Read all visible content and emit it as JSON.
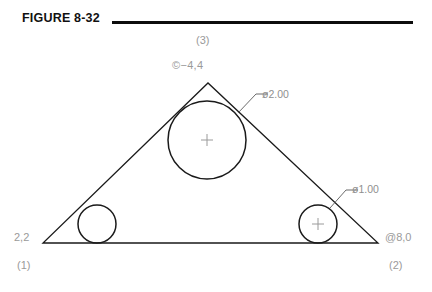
{
  "figure": {
    "title": "FIGURE 8-32",
    "rule_color": "#0d0d0d"
  },
  "drawing": {
    "line_color": "#1a1a1a",
    "annotation_color": "#9a9a9a",
    "triangle": {
      "vertices": [
        {
          "id": "1",
          "label": "(1)",
          "coord_label": "2,2",
          "x": 43,
          "y": 243
        },
        {
          "id": "2",
          "label": "(2)",
          "coord_label": "@8,0",
          "x": 378,
          "y": 243
        },
        {
          "id": "3",
          "label": "(3)",
          "coord_label": "@-4,4",
          "x": 208,
          "y": 83
        }
      ]
    },
    "circles": [
      {
        "name": "apex-circle",
        "cx": 207,
        "cy": 140,
        "r": 39,
        "center_mark": true,
        "dimension": "2.00"
      },
      {
        "name": "bottom-left-circle",
        "cx": 97,
        "cy": 224,
        "r": 19,
        "center_mark": false,
        "dimension": "1.00"
      },
      {
        "name": "bottom-right-circle",
        "cx": 318,
        "cy": 224,
        "r": 19,
        "center_mark": true,
        "dimension": "1.00"
      }
    ],
    "dimensions": [
      {
        "name": "diameter-large",
        "text": "ø2.00"
      },
      {
        "name": "diameter-small",
        "text": "ø1.00"
      }
    ]
  },
  "labels": {
    "vertex_3": "(3)",
    "apex_coord": "©−4,4",
    "dim_large": "ø2.00",
    "dim_small": "ø1.00",
    "start_coord": "2,2",
    "vertex_1": "(1)",
    "end_coord": "@8,0",
    "vertex_2": "(2)"
  }
}
